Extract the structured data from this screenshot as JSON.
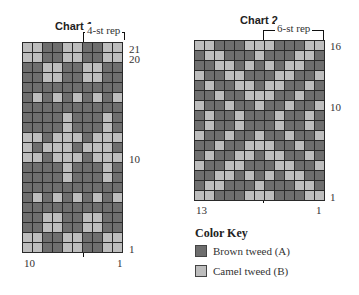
{
  "chart1": {
    "title": "Chart 1",
    "rep_label": "4-st rep",
    "row_labels": {
      "top": "21",
      "second": "20",
      "mid": "10",
      "bottom": "1"
    },
    "col_labels": {
      "left": "10",
      "right": "1"
    },
    "rows": [
      "LLDDLLDDLL",
      "LLDDLLDDLL",
      "DDLLDDLLDD",
      "DDLLDDLLDD",
      "DDDDDDDDDD",
      "DLDLDLDLDL",
      "DDDDDDDDDD",
      "DDDDLDDDLD",
      "DDDDLDDDLD",
      "LLDLLLDLLL",
      "LDLLLDLLLD",
      "LLDLLLDLLL",
      "DDDDLDDDLD",
      "DDDDLDDDLD",
      "DDDDDDDDDD",
      "DLDLDLDLDL",
      "DDDDDDDDDD",
      "DDLLDDLLDD",
      "DDLLDDLLDD",
      "LLDDLLDDLL",
      "LLDDLLDDLL"
    ]
  },
  "chart2": {
    "title": "Chart 2",
    "rep_label": "6-st rep",
    "row_labels": {
      "top": "16",
      "mid": "10",
      "bottom": "1"
    },
    "col_labels": {
      "left": "13",
      "right": "1"
    },
    "rows": [
      "LLDDDLLLDDDLL",
      "DLLDDDLDDDLLD",
      "DDLLDLDLDLLDD",
      "LDDLLDDDLLDDL",
      "DLDDLLDLLDDLD",
      "DDLDDLLLDDLDD",
      "LDDLDDLDDLDDL",
      "DLDDLDDDLDDLD",
      "DLDDLDDDLDDLD",
      "LDDLDDLDDLDDL",
      "DDLDDLLLDDLDD",
      "DLDDLLDLLDDLD",
      "LDDLLDDDLLDDL",
      "DDLLDLDLDLLDD",
      "DLLDDDLDDDLLD",
      "LLDDDLLLDDDLL"
    ]
  },
  "color_key": {
    "title": "Color Key",
    "items": [
      {
        "label": "Brown tweed (A)",
        "code": "D",
        "color": "#6e6e6e"
      },
      {
        "label": "Camel tweed (B)",
        "code": "L",
        "color": "#bdbdbd"
      }
    ]
  }
}
